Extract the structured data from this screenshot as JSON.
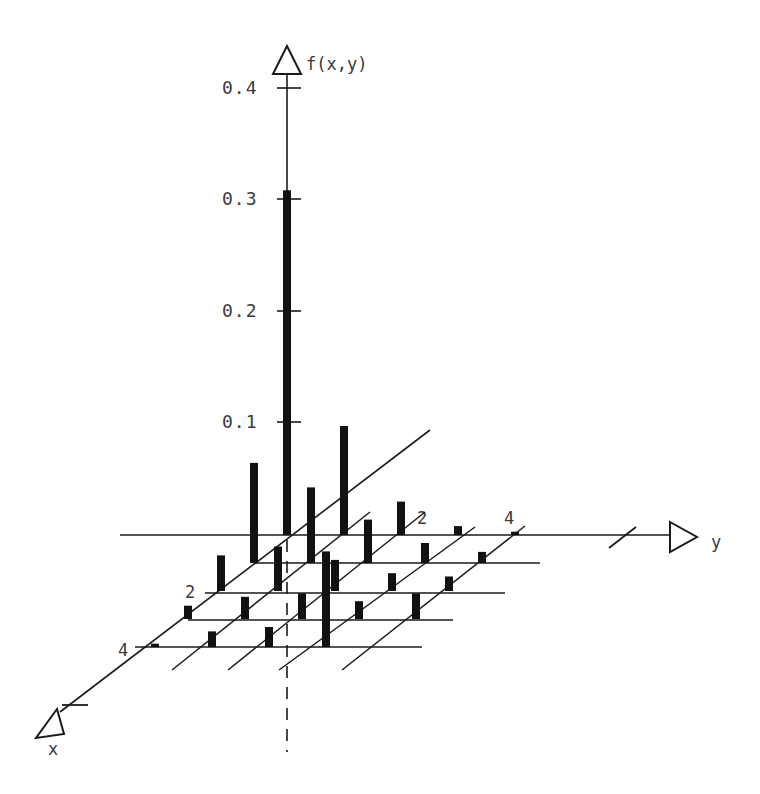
{
  "chart_data": {
    "type": "bar3d",
    "title": "",
    "zlabel": "f(x,y)",
    "xlabel": "x",
    "ylabel": "y",
    "z_ticks": [
      0.1,
      0.2,
      0.3,
      0.4
    ],
    "z_tick_labels": [
      "0.1",
      "0.2",
      "0.3",
      "0.4"
    ],
    "x_tick_labels": [
      {
        "x": 2,
        "label": "2"
      },
      {
        "x": 4,
        "label": "4"
      }
    ],
    "y_tick_labels": [
      {
        "y": 2,
        "label": "2"
      },
      {
        "y": 4,
        "label": "4"
      }
    ],
    "x_values": [
      0,
      1,
      2,
      3,
      4
    ],
    "y_values": [
      0,
      1,
      2,
      3,
      4
    ],
    "zlim": [
      0,
      0.4
    ],
    "grid": true,
    "bars": [
      {
        "x": 0,
        "y": 0,
        "z": 0.31
      },
      {
        "x": 0,
        "y": 1,
        "z": 0.098
      },
      {
        "x": 0,
        "y": 2,
        "z": 0.03
      },
      {
        "x": 0,
        "y": 3,
        "z": 0.008
      },
      {
        "x": 0,
        "y": 4,
        "z": 0.003
      },
      {
        "x": 1,
        "y": 0,
        "z": 0.09
      },
      {
        "x": 1,
        "y": 1,
        "z": 0.068
      },
      {
        "x": 1,
        "y": 2,
        "z": 0.039
      },
      {
        "x": 1,
        "y": 3,
        "z": 0.018
      },
      {
        "x": 1,
        "y": 4,
        "z": 0.01
      },
      {
        "x": 2,
        "y": 0,
        "z": 0.032
      },
      {
        "x": 2,
        "y": 1,
        "z": 0.04
      },
      {
        "x": 2,
        "y": 2,
        "z": 0.028
      },
      {
        "x": 2,
        "y": 3,
        "z": 0.016
      },
      {
        "x": 2,
        "y": 4,
        "z": 0.013
      },
      {
        "x": 3,
        "y": 0,
        "z": 0.012
      },
      {
        "x": 3,
        "y": 1,
        "z": 0.02
      },
      {
        "x": 3,
        "y": 2,
        "z": 0.023
      },
      {
        "x": 3,
        "y": 3,
        "z": 0.016
      },
      {
        "x": 3,
        "y": 4,
        "z": 0.023
      },
      {
        "x": 4,
        "y": 0,
        "z": 0.003
      },
      {
        "x": 4,
        "y": 1,
        "z": 0.014
      },
      {
        "x": 4,
        "y": 2,
        "z": 0.018
      },
      {
        "x": 4,
        "y": 3,
        "z": 0.086
      }
    ]
  },
  "projection": {
    "origin": [
      287,
      535
    ],
    "x_step": [
      -33,
      28
    ],
    "y_step": [
      57,
      0
    ],
    "z_scale": 1112,
    "bar_width": 8
  },
  "labels": {
    "z_axis": "f(x,y)",
    "x_axis": "x",
    "y_axis": "y",
    "z_ticks": [
      "0.1",
      "0.2",
      "0.3",
      "0.4"
    ],
    "x_tick_2": "2",
    "x_tick_4": "4",
    "y_tick_2": "2",
    "y_tick_4": "4"
  },
  "colors": {
    "ink": "#1a1a1a",
    "bar": "#111111",
    "text": "#3a3a3a",
    "background": "#ffffff"
  }
}
